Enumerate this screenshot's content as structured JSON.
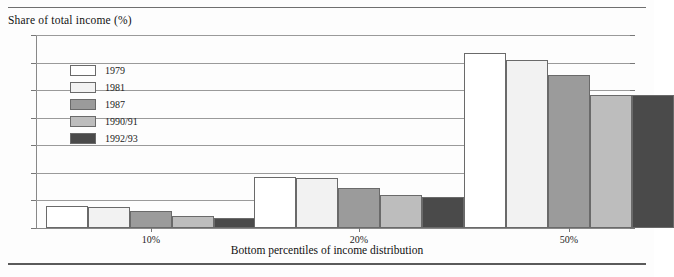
{
  "figure": {
    "title": "Share of total income (%)",
    "xaxis_caption": "Bottom percentiles of income distribution"
  },
  "legend": {
    "position": "inside-top-left",
    "items": [
      {
        "label": "1979",
        "color": "#ffffff"
      },
      {
        "label": "1981",
        "color": "#f2f2f2"
      },
      {
        "label": "1987",
        "color": "#9b9b9b"
      },
      {
        "label": "1990/91",
        "color": "#bdbdbd"
      },
      {
        "label": "1992/93",
        "color": "#4a4a4a"
      }
    ]
  },
  "yaxis": {
    "ticks": [
      "0",
      "5",
      "10",
      "15",
      "20",
      "25",
      "30",
      "35"
    ]
  },
  "chart_data": {
    "type": "bar",
    "title": "Share of total income (%)",
    "xlabel": "Bottom percentiles of income distribution",
    "ylabel": "Share of total income (%)",
    "ylim": [
      0,
      35
    ],
    "yticks": [
      0,
      5,
      10,
      15,
      20,
      25,
      30,
      35
    ],
    "grid": true,
    "legend_position": "inside-top-left",
    "categories": [
      "10%",
      "20%",
      "50%"
    ],
    "series": [
      {
        "name": "1979",
        "color": "#ffffff",
        "values": [
          4.0,
          9.3,
          31.8
        ]
      },
      {
        "name": "1981",
        "color": "#f2f2f2",
        "values": [
          3.8,
          9.0,
          30.5
        ]
      },
      {
        "name": "1987",
        "color": "#9b9b9b",
        "values": [
          3.0,
          7.3,
          27.8
        ]
      },
      {
        "name": "1990/91",
        "color": "#bdbdbd",
        "values": [
          2.2,
          6.0,
          24.2
        ]
      },
      {
        "name": "1992/93",
        "color": "#4a4a4a",
        "values": [
          1.8,
          5.7,
          24.2
        ]
      }
    ]
  }
}
